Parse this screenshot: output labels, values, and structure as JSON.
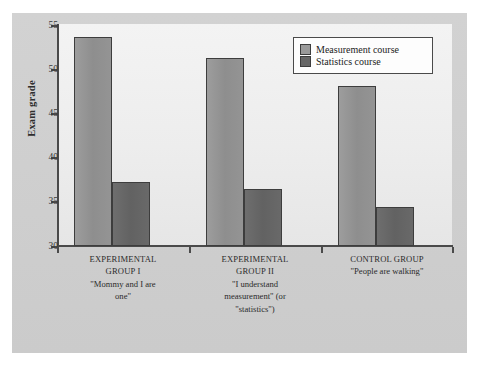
{
  "chart_data": {
    "type": "bar",
    "title": "",
    "subtitle": "",
    "xlabel": "",
    "ylabel": "Exam grade",
    "ylim": [
      30,
      55
    ],
    "yticks": [
      30,
      35,
      40,
      45,
      50,
      55
    ],
    "ytick_labels": [
      "30",
      "35",
      "40",
      "45",
      "50",
      "55"
    ],
    "grid": false,
    "legend_position": "top-right",
    "categories": [
      "EXPERIMENTAL GROUP I",
      "EXPERIMENTAL GROUP II",
      "CONTROL GROUP"
    ],
    "category_sublabels": [
      "\"Mommy and I are one\"",
      "\"I understand measurement\" (or \"statistics\")",
      "\"People are walking\""
    ],
    "series": [
      {
        "name": "Measurement course",
        "color": "#949494",
        "values": [
          53.7,
          51.3,
          48.1
        ]
      },
      {
        "name": "Statistics course",
        "color": "#676767",
        "values": [
          37.2,
          36.4,
          34.4
        ]
      }
    ]
  },
  "axes": {
    "y_title": "Exam grade",
    "y_ticks": [
      {
        "label": "55",
        "value": 55
      },
      {
        "label": "50",
        "value": 50
      },
      {
        "label": "45",
        "value": 45
      },
      {
        "label": "40",
        "value": 40
      },
      {
        "label": "35",
        "value": 35
      },
      {
        "label": "30",
        "value": 30
      }
    ]
  },
  "legend": {
    "entries": [
      {
        "label": "Measurement course",
        "swatch": "measurement"
      },
      {
        "label": "Statistics course",
        "swatch": "statistics"
      }
    ]
  },
  "groups": [
    {
      "title_line1": "EXPERIMENTAL",
      "title_line2": "GROUP I",
      "quote_line1": "\"Mommy and I are",
      "quote_line2": "one\"",
      "quote_line3": ""
    },
    {
      "title_line1": "EXPERIMENTAL",
      "title_line2": "GROUP II",
      "quote_line1": "\"I understand",
      "quote_line2": "measurement\" (or",
      "quote_line3": "\"statistics\")"
    },
    {
      "title_line1": "CONTROL GROUP",
      "title_line2": "",
      "quote_line1": "\"People are walking\"",
      "quote_line2": "",
      "quote_line3": ""
    }
  ],
  "colors": {
    "measurement_bar": "#949494",
    "statistics_bar": "#676767",
    "bar_border": "#3d3d3d",
    "axis": "#4a4a4a",
    "figure_background": "#cfcfcf",
    "plot_background": "#ededed"
  }
}
